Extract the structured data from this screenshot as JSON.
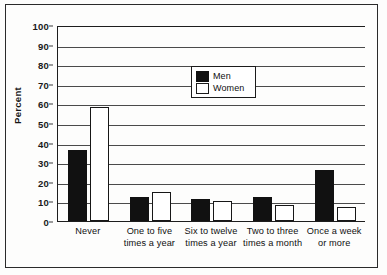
{
  "chart_data": {
    "type": "bar",
    "title": "",
    "xlabel": "",
    "ylabel": "Percent",
    "ylim": [
      0,
      100
    ],
    "ytick_step": 10,
    "yticks": [
      0,
      10,
      20,
      30,
      40,
      50,
      60,
      70,
      80,
      90,
      100
    ],
    "grid": true,
    "legend_position": "upper-center",
    "categories": [
      "Never",
      "One to five\ntimes a year",
      "Six to twelve\ntimes a year",
      "Two to three\ntimes a month",
      "Once a week\nor more"
    ],
    "series": [
      {
        "name": "Men",
        "color": "#111111",
        "values": [
          36,
          12,
          11,
          12,
          26
        ]
      },
      {
        "name": "Women",
        "color": "#ffffff",
        "values": [
          58,
          15,
          10,
          8,
          7
        ]
      }
    ]
  },
  "legend": {
    "items": [
      {
        "label": "Men",
        "swatch": "black-filled-square"
      },
      {
        "label": "Women",
        "swatch": "white-outlined-square"
      }
    ]
  },
  "axis": {
    "y_title": "Percent",
    "y_labels": [
      "100",
      "90",
      "80",
      "70",
      "60",
      "50",
      "40",
      "30",
      "20",
      "10",
      "0"
    ]
  },
  "colors": {
    "men_bar": "#111111",
    "women_bar": "#ffffff",
    "bar_outline": "#171717",
    "gridline": "#4a4a4a",
    "axis": "#1d1d1d",
    "frame": "#2a2a2a",
    "background": "#fdfdfc"
  }
}
